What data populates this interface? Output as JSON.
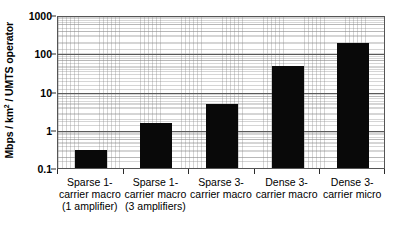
{
  "chart_data": {
    "type": "bar",
    "title": "",
    "subtitle": "",
    "xlabel": "",
    "ylabel": "Mbps / km² / UMTS operator",
    "ylabel_parts": {
      "pre": "Mbps / km",
      "sup": "2",
      "post": " / UMTS operator"
    },
    "yscale": "log",
    "ylim": [
      0.1,
      1000
    ],
    "ytick_labels": [
      "1000",
      "100",
      "10",
      "1",
      "0.1"
    ],
    "ytick_values": [
      1000,
      100,
      10,
      1,
      0.1
    ],
    "grid": true,
    "grid_minor": true,
    "legend": "none",
    "bar_color": "#090909",
    "categories": [
      "Sparse 1-carrier macro (1 amplifier)",
      "Sparse 1-carrier macro (3 amplifiers)",
      "Sparse 3-carrier macro",
      "Dense 3-carrier macro",
      "Dense 3-carrier micro"
    ],
    "category_lines": [
      [
        "Sparse 1-",
        "carrier macro",
        "(1 amplifier)"
      ],
      [
        "Sparse 1-",
        "carrier macro",
        "(3 amplifiers)"
      ],
      [
        "Sparse 3-",
        "carrier macro"
      ],
      [
        "Dense 3-",
        "carrier macro"
      ],
      [
        "Dense 3-",
        "carrier micro"
      ]
    ],
    "values": [
      0.3,
      1.5,
      4.8,
      47,
      190
    ]
  }
}
